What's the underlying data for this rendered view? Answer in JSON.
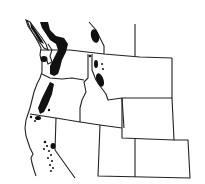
{
  "map": {
    "type": "species-distribution-range-map",
    "region": "Western North America",
    "range_color": "#111111",
    "border_color": "#222222",
    "background": "#ffffff",
    "labels": []
  }
}
